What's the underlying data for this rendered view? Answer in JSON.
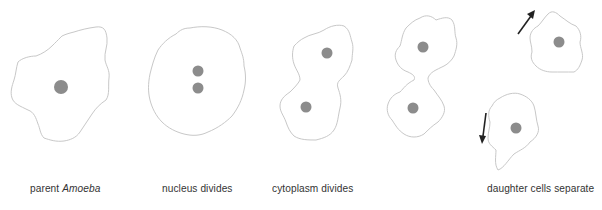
{
  "diagram": {
    "colors": {
      "cell_outline": "#c8c8c8",
      "nucleus": "#8c8c8c",
      "arrow": "#222222",
      "text": "#333333",
      "background": "#ffffff"
    },
    "stages": [
      {
        "id": "parent",
        "label_prefix": "parent ",
        "label_italic": "Amoeba",
        "nuclei": 1
      },
      {
        "id": "nucleus-divides",
        "label": "nucleus divides",
        "nuclei": 2
      },
      {
        "id": "cytoplasm-divides",
        "label": "cytoplasm divides",
        "nuclei": 2
      },
      {
        "id": "pinching",
        "label": "",
        "nuclei": 2
      },
      {
        "id": "daughter-cells",
        "label": "daughter cells separate",
        "nuclei": 2,
        "arrows": [
          "up-right",
          "down"
        ]
      }
    ]
  }
}
